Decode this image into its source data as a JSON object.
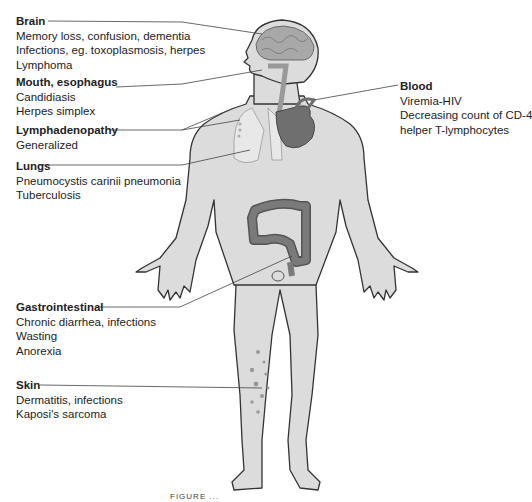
{
  "labels": [
    {
      "id": "brain",
      "title": "Brain",
      "lines": [
        "Memory loss, confusion, dementia",
        "Infections, eg. toxoplasmosis, herpes",
        "Lymphoma"
      ]
    },
    {
      "id": "mouth",
      "title": "Mouth, esophagus",
      "lines": [
        "Candidiasis",
        "Herpes simplex"
      ]
    },
    {
      "id": "lymph",
      "title": "Lymphadenopathy",
      "lines": [
        "Generalized"
      ]
    },
    {
      "id": "lungs",
      "title": "Lungs",
      "lines": [
        "Pneumocystis carinii pneumonia",
        "Tuberculosis"
      ]
    },
    {
      "id": "blood",
      "title": "Blood",
      "lines": [
        "Viremia-HIV",
        "Decreasing count of CD-4",
        "helper T-lymphocytes"
      ]
    },
    {
      "id": "gi",
      "title": "Gastrointestinal",
      "lines": [
        "Chronic diarrhea, infections",
        "Wasting",
        "Anorexia"
      ]
    },
    {
      "id": "skin",
      "title": "Skin",
      "lines": [
        "Dermatitis, infections",
        "Kaposi's sarcoma"
      ]
    }
  ],
  "caption": "FIGURE ..."
}
